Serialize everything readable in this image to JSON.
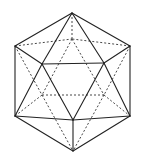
{
  "diagram": {
    "colors": {
      "background": "#ffffff",
      "solid_edge": "#222222",
      "dashed_edge": "#333333"
    },
    "vertices": {
      "T": [
        72,
        13
      ],
      "B": [
        73,
        151
      ],
      "UL": [
        15,
        46
      ],
      "UR": [
        130,
        46
      ],
      "LL": [
        15,
        116
      ],
      "LR": [
        130,
        116
      ],
      "F1": [
        42,
        64
      ],
      "F2": [
        104,
        63
      ],
      "F3": [
        73,
        120
      ],
      "K1": [
        72,
        39
      ],
      "K2": [
        42,
        95
      ],
      "K3": [
        104,
        95
      ]
    },
    "solid_edges": [
      [
        "T",
        "UL"
      ],
      [
        "T",
        "UR"
      ],
      [
        "T",
        "F1"
      ],
      [
        "T",
        "F2"
      ],
      [
        "UL",
        "LL"
      ],
      [
        "UR",
        "LR"
      ],
      [
        "UL",
        "F1"
      ],
      [
        "UR",
        "F2"
      ],
      [
        "F1",
        "F2"
      ],
      [
        "F1",
        "F3"
      ],
      [
        "F2",
        "F3"
      ],
      [
        "F1",
        "LL"
      ],
      [
        "F2",
        "LR"
      ],
      [
        "LL",
        "F3"
      ],
      [
        "LR",
        "F3"
      ],
      [
        "LL",
        "B"
      ],
      [
        "LR",
        "B"
      ],
      [
        "F3",
        "B"
      ]
    ],
    "dashed_edges": [
      [
        "T",
        "K1"
      ],
      [
        "UL",
        "K1"
      ],
      [
        "UR",
        "K1"
      ],
      [
        "K1",
        "K2"
      ],
      [
        "K1",
        "K3"
      ],
      [
        "K2",
        "K3"
      ],
      [
        "UL",
        "K2"
      ],
      [
        "UR",
        "K3"
      ],
      [
        "K2",
        "LL"
      ],
      [
        "K3",
        "LR"
      ],
      [
        "K2",
        "B"
      ],
      [
        "K3",
        "B"
      ]
    ]
  }
}
